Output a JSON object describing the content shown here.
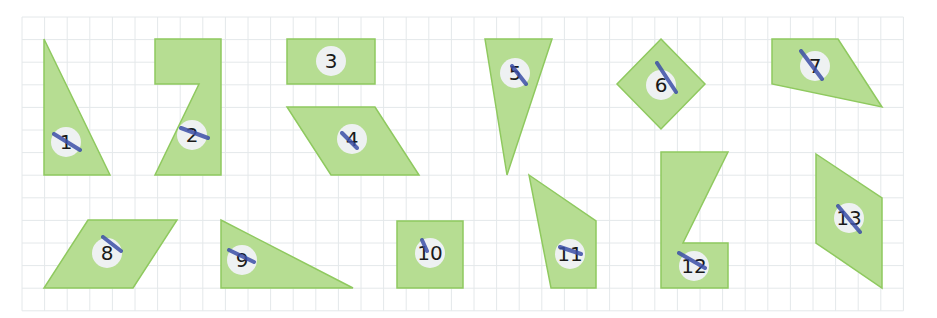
{
  "diagram": {
    "grid": {
      "origin_x": 22,
      "origin_y": 17,
      "cell": 22.6,
      "cols": 39,
      "rows": 13,
      "line_color": "#e4e8ea"
    },
    "colors": {
      "fill": "#b6dd92",
      "stroke": "#8fc95f",
      "label_bg": "#eef1f2",
      "pen_mark": "#3c4fa8"
    },
    "shapes": [
      {
        "id": 1,
        "label": "1",
        "kind": "right triangle",
        "points": [
          [
            44,
            39
          ],
          [
            44,
            175
          ],
          [
            110,
            175
          ]
        ],
        "label_pos": [
          66,
          142
        ],
        "mark": [
          [
            54,
            134
          ],
          [
            80,
            150
          ]
        ]
      },
      {
        "id": 2,
        "label": "2",
        "kind": "hexagon (L-shape)",
        "points": [
          [
            155,
            39
          ],
          [
            221,
            39
          ],
          [
            221,
            175
          ],
          [
            155,
            175
          ],
          [
            199,
            84
          ],
          [
            155,
            84
          ]
        ],
        "label_pos": [
          192,
          135
        ],
        "mark": [
          [
            181,
            128
          ],
          [
            208,
            138
          ]
        ]
      },
      {
        "id": 3,
        "label": "3",
        "kind": "rectangle",
        "points": [
          [
            287,
            39
          ],
          [
            375,
            39
          ],
          [
            375,
            84
          ],
          [
            287,
            84
          ]
        ],
        "label_pos": [
          331,
          61
        ],
        "mark": null
      },
      {
        "id": 4,
        "label": "4",
        "kind": "parallelogram",
        "points": [
          [
            287,
            107
          ],
          [
            375,
            107
          ],
          [
            419,
            175
          ],
          [
            331,
            175
          ]
        ],
        "label_pos": [
          352,
          139
        ],
        "mark": [
          [
            342,
            133
          ],
          [
            357,
            148
          ]
        ]
      },
      {
        "id": 5,
        "label": "5",
        "kind": "triangle",
        "points": [
          [
            485,
            39
          ],
          [
            552,
            39
          ],
          [
            507,
            175
          ]
        ],
        "label_pos": [
          515,
          73
        ],
        "mark": [
          [
            512,
            66
          ],
          [
            526,
            84
          ]
        ]
      },
      {
        "id": 6,
        "label": "6",
        "kind": "square (rotated)",
        "points": [
          [
            661,
            39
          ],
          [
            705,
            84
          ],
          [
            661,
            129
          ],
          [
            617,
            84
          ]
        ],
        "label_pos": [
          661,
          85
        ],
        "mark": [
          [
            657,
            63
          ],
          [
            676,
            92
          ]
        ]
      },
      {
        "id": 7,
        "label": "7",
        "kind": "quadrilateral",
        "points": [
          [
            772,
            39
          ],
          [
            838,
            39
          ],
          [
            882,
            107
          ],
          [
            772,
            84
          ]
        ],
        "label_pos": [
          815,
          66
        ],
        "mark": [
          [
            801,
            51
          ],
          [
            822,
            79
          ]
        ]
      },
      {
        "id": 8,
        "label": "8",
        "kind": "parallelogram",
        "points": [
          [
            88,
            220
          ],
          [
            177,
            220
          ],
          [
            133,
            288
          ],
          [
            44,
            288
          ]
        ],
        "label_pos": [
          107,
          253
        ],
        "mark": [
          [
            103,
            237
          ],
          [
            121,
            251
          ]
        ]
      },
      {
        "id": 9,
        "label": "9",
        "kind": "right triangle",
        "points": [
          [
            221,
            220
          ],
          [
            221,
            288
          ],
          [
            353,
            288
          ]
        ],
        "label_pos": [
          242,
          260
        ],
        "mark": [
          [
            229,
            250
          ],
          [
            254,
            262
          ]
        ]
      },
      {
        "id": 10,
        "label": "10",
        "kind": "square",
        "points": [
          [
            397,
            221
          ],
          [
            463,
            221
          ],
          [
            463,
            288
          ],
          [
            397,
            288
          ]
        ],
        "label_pos": [
          430,
          253
        ],
        "mark": [
          [
            422,
            240
          ],
          [
            427,
            251
          ]
        ]
      },
      {
        "id": 11,
        "label": "11",
        "kind": "quadrilateral",
        "points": [
          [
            529,
            175
          ],
          [
            596,
            221
          ],
          [
            596,
            288
          ],
          [
            551,
            288
          ]
        ],
        "label_pos": [
          570,
          254
        ],
        "mark": [
          [
            560,
            247
          ],
          [
            581,
            254
          ]
        ]
      },
      {
        "id": 12,
        "label": "12",
        "kind": "hexagon (Z-shape)",
        "points": [
          [
            661,
            152
          ],
          [
            728,
            152
          ],
          [
            683,
            243
          ],
          [
            728,
            243
          ],
          [
            728,
            288
          ],
          [
            661,
            288
          ]
        ],
        "label_pos": [
          694,
          266
        ],
        "mark": [
          [
            679,
            253
          ],
          [
            705,
            268
          ]
        ]
      },
      {
        "id": 13,
        "label": "13",
        "kind": "parallelogram",
        "points": [
          [
            816,
            154
          ],
          [
            882,
            198
          ],
          [
            882,
            288
          ],
          [
            816,
            243
          ]
        ],
        "label_pos": [
          849,
          218
        ],
        "mark": [
          [
            838,
            206
          ],
          [
            860,
            232
          ]
        ]
      }
    ]
  }
}
